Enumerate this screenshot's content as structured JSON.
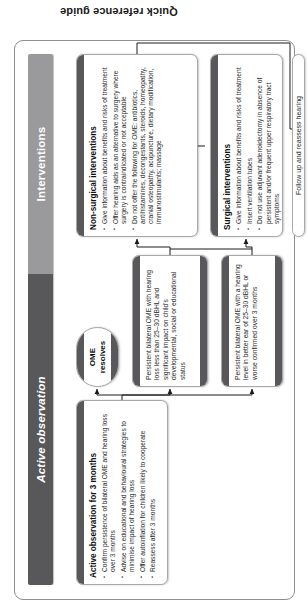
{
  "document": {
    "side_label": "Quick reference guide"
  },
  "banner": {
    "left_label": "Active observation",
    "right_label": "Interventions"
  },
  "nodes": {
    "active_observation": {
      "title": "Active observation for 3 months",
      "bullets": [
        "Confirm persistence of bilateral OME and hearing loss over 3 months",
        "Advise on educational and behavioural strategies to minimise impact of hearing loss",
        "Offer autoinflation for children likely to cooperate",
        "Reassess after 3 months"
      ]
    },
    "ome_resolves": {
      "label": "OME resolves"
    },
    "persistent_significant_impact": {
      "text": "Persistent bilateral OME with hearing loss less than 25–30 dBHL and significant impact on child's developmental, social or educational status"
    },
    "persistent_hearing_level": {
      "text": "Persistent bilateral OME with a hearing level in better ear of 25–30 dBHL or worse confirmed over 3 months"
    },
    "non_surgical": {
      "title": "Non-surgical interventions",
      "bullets": [
        "Give information about benefits and risks of treatment",
        "Offer hearing aids as an alternative to surgery where surgery is contraindicated or not acceptable",
        "Do not offer the following for OME: antibiotics, antihistamines, decongestants, steroids, homeopathy, cranial osteopathy, acupuncture, dietary modification, immunostimulants; massage"
      ]
    },
    "surgical": {
      "title": "Surgical interventions",
      "bullets": [
        "Give information about benefits and risks of treatment",
        "Insert ventilation tubes",
        "Do not use adjuvant adenoidectomy in absence of persistent and/or frequent upper respiratory tract symptoms"
      ]
    },
    "follow_up": {
      "label": "Follow up and reassess hearing"
    }
  },
  "colors": {
    "banner_left": "#58585a",
    "banner_right": "#9a9a9c",
    "card_cap": "#58585a",
    "card_border": "#a8a8a8",
    "frame_border": "#8f8f8f",
    "text": "#2b2b2b"
  }
}
